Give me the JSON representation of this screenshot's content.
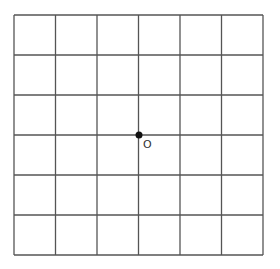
{
  "diagram": {
    "type": "coordinate-grid",
    "grid": {
      "columns": 6,
      "rows": 6,
      "left": 14,
      "top": 15,
      "right": 263,
      "bottom": 255,
      "line_color": "#555555"
    },
    "origin": {
      "label": "O",
      "cx": 139,
      "cy": 135,
      "radius": 3.5,
      "color": "#111111"
    }
  }
}
